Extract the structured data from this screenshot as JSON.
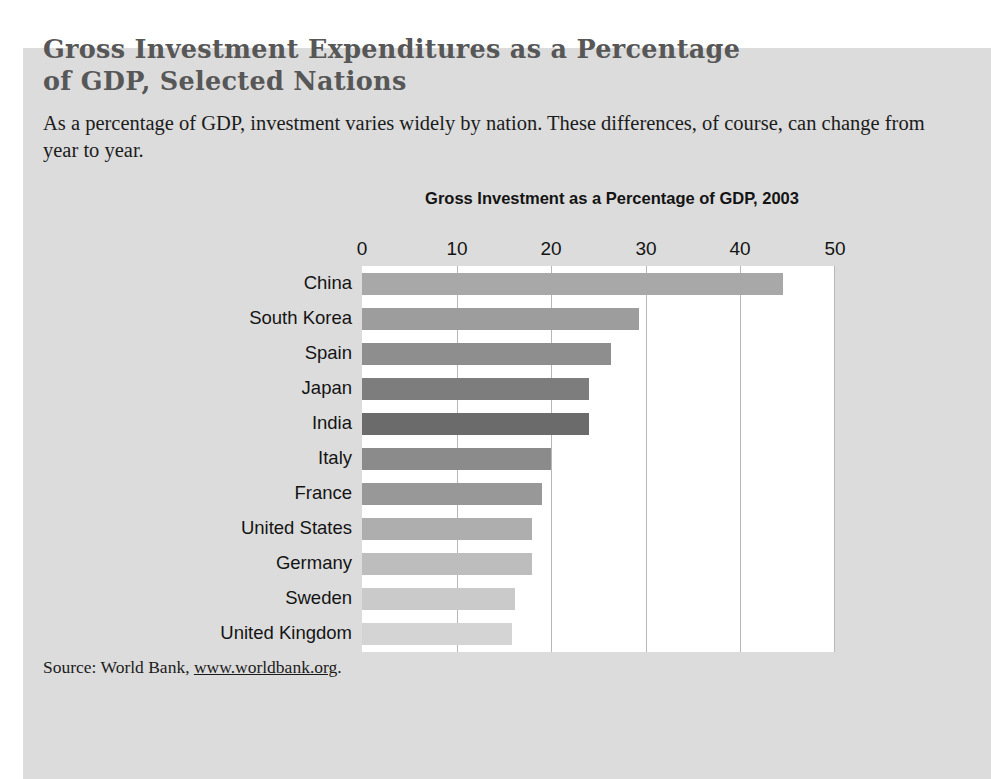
{
  "figure": {
    "title": "Gross Investment Expenditures as a Percentage of GDP, Selected Nations",
    "subtitle": "As a percentage of GDP, investment varies widely by nation. These differences, of course, can change from year to year.",
    "source_prefix": "Source: World Bank, ",
    "source_link": "www.worldbank.org",
    "source_suffix": "."
  },
  "colors": {
    "page_background": "#ffffff",
    "panel_background": "#dcdcdc",
    "plot_background": "#ffffff",
    "gridline": "#b7b7b7",
    "title_text": "#575757",
    "body_text": "#1b1b1b",
    "chart_text": "#141414"
  },
  "chart_data": {
    "type": "bar",
    "orientation": "horizontal",
    "title": "Gross Investment as a Percentage of GDP, 2003",
    "xlabel": "",
    "ylabel": "",
    "xlim": [
      0,
      50
    ],
    "xticks": [
      0,
      10,
      20,
      30,
      40,
      50
    ],
    "xtick_labels": [
      "0",
      "10",
      "20",
      "30",
      "40",
      "50"
    ],
    "grid": "vertical",
    "legend": "none",
    "categories": [
      "China",
      "South Korea",
      "Spain",
      "Japan",
      "India",
      "Italy",
      "France",
      "United States",
      "Germany",
      "Sweden",
      "United Kingdom"
    ],
    "values": [
      44.5,
      29.3,
      26.3,
      24.0,
      24.0,
      20.0,
      19.0,
      18.0,
      18.0,
      16.2,
      15.9
    ],
    "bar_colors": [
      "#a8a8a8",
      "#9d9d9d",
      "#8e8e8e",
      "#7d7d7d",
      "#6b6b6b",
      "#8b8b8b",
      "#989898",
      "#aeaeae",
      "#bdbdbd",
      "#cacaca",
      "#d4d4d4"
    ]
  }
}
